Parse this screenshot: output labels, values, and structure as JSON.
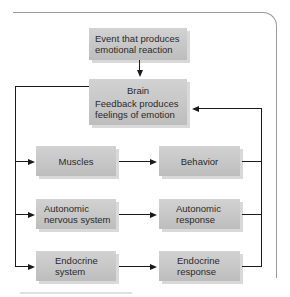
{
  "diagram": {
    "nodes": {
      "event": {
        "line1": "Event that produces",
        "line2": "emotional reaction"
      },
      "brain": {
        "title": "Brain",
        "line1": "Feedback produces",
        "line2": "feelings of emotion"
      },
      "muscles": {
        "line1": "Muscles"
      },
      "behavior": {
        "line1": "Behavior"
      },
      "ans": {
        "line1": "Autonomic",
        "line2": "nervous system"
      },
      "ans_response": {
        "line1": "Autonomic",
        "line2": "response"
      },
      "endocrine": {
        "line1": "Endocrine",
        "line2": "system"
      },
      "endocrine_response": {
        "line1": "Endocrine",
        "line2": "response"
      }
    },
    "edges": [
      [
        "event",
        "brain"
      ],
      [
        "brain",
        "muscles"
      ],
      [
        "brain",
        "ans"
      ],
      [
        "brain",
        "endocrine"
      ],
      [
        "muscles",
        "behavior"
      ],
      [
        "ans",
        "ans_response"
      ],
      [
        "endocrine",
        "endocrine_response"
      ],
      [
        "behavior",
        "brain"
      ],
      [
        "ans_response",
        "brain"
      ],
      [
        "endocrine_response",
        "brain"
      ]
    ],
    "colors": {
      "box": "#c6c6c6",
      "line": "#1a1a1a",
      "frame": "#9a9a9a"
    }
  }
}
